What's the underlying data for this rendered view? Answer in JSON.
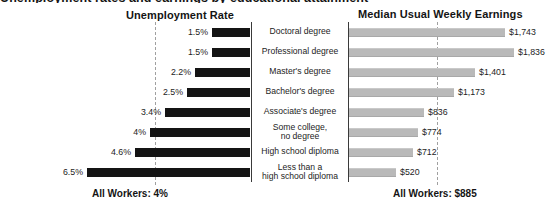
{
  "title_clipped": "Unemployment rates and earnings by educational attainment",
  "headers": {
    "left": "Unemployment Rate",
    "right": "Median Usual Weekly Earnings"
  },
  "footers": {
    "left": "All Workers: 4%",
    "right": "All Workers: $885"
  },
  "colors": {
    "unemployment_bar": "#141414",
    "earnings_bar": "#b9b9b9",
    "reference_line": "#a0a0a0",
    "axis": "#3a3a3a",
    "text": "#1d1d1d",
    "background": "#ffffff"
  },
  "chart_data": {
    "type": "bar",
    "title": "Unemployment rates and earnings by educational attainment",
    "orientation": "horizontal",
    "layout": "diverging-tornado",
    "categories": [
      "Doctoral degree",
      "Professional degree",
      "Master's degree",
      "Bachelor's degree",
      "Associate's degree",
      "Some college,\nno degree",
      "High school diploma",
      "Less than a\nhigh school diploma"
    ],
    "series": [
      {
        "name": "Unemployment Rate",
        "side": "left",
        "unit": "percent",
        "labels": [
          "1.5%",
          "1.5%",
          "2.2%",
          "2.5%",
          "3.4%",
          "4%",
          "4.6%",
          "6.5%"
        ],
        "values": [
          1.5,
          1.5,
          2.2,
          2.5,
          3.4,
          4.0,
          4.6,
          6.5
        ],
        "axis_max": 7.0,
        "reference_line": {
          "label": "All Workers: 4%",
          "value": 4.0
        }
      },
      {
        "name": "Median Usual Weekly Earnings",
        "side": "right",
        "unit": "usd_per_week",
        "labels": [
          "$1,743",
          "$1,836",
          "$1,401",
          "$1,173",
          "$836",
          "$774",
          "$712",
          "$520"
        ],
        "values": [
          1743,
          1836,
          1401,
          1173,
          836,
          774,
          712,
          520
        ],
        "axis_max": 1950,
        "reference_line": {
          "label": "All Workers: $885",
          "value": 885
        }
      }
    ],
    "xlabel": "",
    "ylabel": "",
    "grid": false,
    "legend": false
  }
}
